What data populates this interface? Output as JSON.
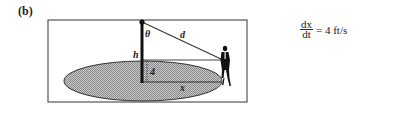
{
  "part_label": "(b)",
  "diagram": {
    "labels": {
      "theta": "θ",
      "d": "d",
      "h": "h",
      "four": "4",
      "x": "x"
    },
    "colors": {
      "frame": "#555555",
      "ellipse_fill": "#b5b5b5",
      "ellipse_stroke": "#333333",
      "pole": "#111111",
      "line": "#333333",
      "person": "#111111"
    }
  },
  "equation": {
    "numerator": "dx",
    "denominator": "dt",
    "rest": "= 4 ft/s"
  }
}
